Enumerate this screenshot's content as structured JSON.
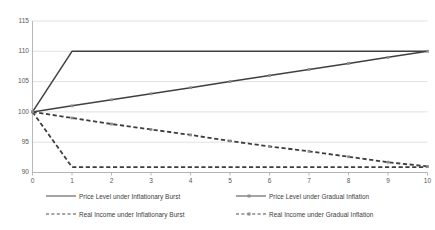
{
  "chart_data": {
    "type": "line",
    "title": "",
    "xlabel": "",
    "ylabel": "",
    "xlim": [
      0,
      10
    ],
    "ylim": [
      90,
      115
    ],
    "grid": true,
    "legend_position": "bottom",
    "x": [
      0,
      1,
      2,
      3,
      4,
      5,
      6,
      7,
      8,
      9,
      10
    ],
    "xticks": [
      "0",
      "1",
      "2",
      "3",
      "4",
      "5",
      "6",
      "7",
      "8",
      "9",
      "10"
    ],
    "yticks": [
      "90",
      "95",
      "100",
      "105",
      "110",
      "115"
    ],
    "series": [
      {
        "name": "Price Level under Inflationary Burst",
        "style": "solid",
        "markers": false,
        "color": "#404040",
        "values": [
          100,
          110,
          110,
          110,
          110,
          110,
          110,
          110,
          110,
          110,
          110
        ]
      },
      {
        "name": "Price Level under Gradual Inflation",
        "style": "solid",
        "markers": true,
        "color": "#404040",
        "values": [
          100,
          101,
          102,
          103,
          104,
          105,
          106,
          107,
          108,
          109,
          110
        ]
      },
      {
        "name": "Real Income under Inflationary Burst",
        "style": "dashed",
        "markers": false,
        "color": "#3d3d3d",
        "values": [
          100,
          90.9,
          90.9,
          90.9,
          90.9,
          90.9,
          90.9,
          90.9,
          90.9,
          90.9,
          90.9
        ]
      },
      {
        "name": "Real Income under Gradual Inflation",
        "style": "dashed",
        "markers": true,
        "color": "#3d3d3d",
        "values": [
          100,
          99.0,
          98.0,
          97.1,
          96.2,
          95.2,
          94.3,
          93.5,
          92.6,
          91.7,
          91.0
        ]
      }
    ]
  },
  "colors": {
    "gridline": "#d9d9d9",
    "axis": "#b0b0b0",
    "tick_text": "#595959",
    "legend_text": "#3a3a3a",
    "marker": "#8d8d8d",
    "background": "#ffffff"
  }
}
